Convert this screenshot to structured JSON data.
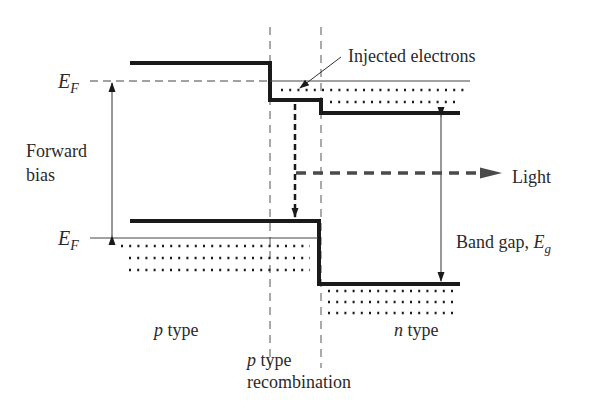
{
  "labels": {
    "ef_top": "E",
    "ef_top_sub": "F",
    "ef_bottom": "E",
    "ef_bottom_sub": "F",
    "forward": "Forward",
    "bias": "bias",
    "injected": "Injected electrons",
    "light": "Light",
    "band_gap": "Band gap, ",
    "band_gap_sym": "E",
    "band_gap_sub": "g",
    "p_type_italic": "p",
    "p_type_rest": " type",
    "n_type_italic": "n",
    "n_type_rest": " type",
    "recomb_p": "p",
    "recomb_type": " type",
    "recomb_word": "recombination"
  },
  "colors": {
    "ink": "#1a1a1a",
    "thin": "#444444",
    "light_arrow": "#4a4a4a"
  }
}
